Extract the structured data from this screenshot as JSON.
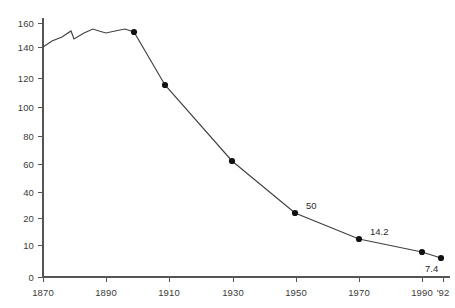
{
  "chart_data": {
    "type": "line",
    "title": "",
    "subtitle": "",
    "xlabel": "",
    "ylabel": "",
    "grid": false,
    "legend": false,
    "line_color": "#404040",
    "marker_color": "#111111",
    "axis_color": "#555555",
    "text_color": "#3a3a3a",
    "xlim": [
      1870,
      1992
    ],
    "ylim": [
      0,
      165
    ],
    "ytick_labels": [
      "160",
      "140",
      "120",
      "100",
      "80",
      "60",
      "40",
      "20",
      "10",
      "0"
    ],
    "ytick_values": [
      160,
      140,
      120,
      100,
      80,
      60,
      40,
      20,
      10,
      0
    ],
    "ytick_py": [
      23,
      47,
      78,
      107,
      136,
      164,
      192,
      218,
      245,
      277
    ],
    "xtick_labels": [
      "1870",
      "1890",
      "1910",
      "1930",
      "1950",
      "1970",
      "1990",
      "'92"
    ],
    "xtick_values": [
      1870,
      1890,
      1910,
      1930,
      1950,
      1970,
      1990,
      1992
    ],
    "xtick_px": [
      43,
      106,
      169,
      233,
      296,
      359,
      422,
      443
    ],
    "series": [
      {
        "name": "series-1",
        "x": [
          1870,
          1873,
          1876,
          1879,
          1880,
          1883,
          1886,
          1888,
          1890,
          1893,
          1896,
          1900,
          1910,
          1930,
          1950,
          1970,
          1990,
          1992
        ],
        "y": [
          140,
          143,
          146,
          150,
          144,
          149,
          153,
          151,
          149,
          151,
          153,
          154,
          117,
          61,
          21,
          12,
          9,
          7.4
        ],
        "px": [
          43,
          52,
          62,
          71,
          74,
          84,
          93,
          99,
          106,
          115,
          125,
          134,
          165,
          232,
          295,
          359,
          422,
          441
        ],
        "py": [
          47,
          41,
          37,
          31,
          39,
          33,
          29,
          31,
          33,
          31,
          29,
          32,
          85,
          161,
          213,
          239,
          252,
          258
        ],
        "markers_at_x": [
          1900,
          1910,
          1930,
          1950,
          1970,
          1990,
          1992
        ]
      }
    ],
    "point_labels": [
      {
        "text": "50",
        "px": 306,
        "py": 200
      },
      {
        "text": "14.2",
        "px": 370,
        "py": 226
      },
      {
        "text": "7.4",
        "px": 425,
        "py": 263
      }
    ]
  }
}
